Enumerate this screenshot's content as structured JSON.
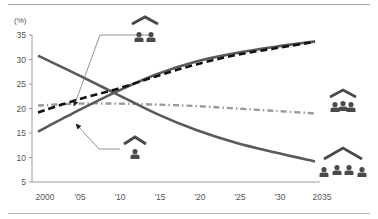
{
  "chart_data": {
    "type": "line",
    "title": "",
    "ylabel": "(%)",
    "xlabel": "",
    "ylim": [
      5,
      35
    ],
    "yticks": [
      5,
      10,
      15,
      20,
      25,
      30,
      35
    ],
    "x": [
      2000,
      2005,
      2010,
      2015,
      2020,
      2025,
      2030,
      2035
    ],
    "xtick_labels": [
      "2000",
      "'05",
      "'10",
      "'15",
      "'20",
      "'25",
      "'30",
      "2035"
    ],
    "grid": false,
    "legend": "icons placed next to lines (no text legend)",
    "series": [
      {
        "name": "single-person household",
        "icon": "house-one-person-icon",
        "style": "solid",
        "color": "#5a5a5a",
        "values": [
          30.8,
          26.9,
          22.9,
          18.9,
          15.6,
          13.0,
          11.0,
          9.2
        ]
      },
      {
        "name": "couple-only household",
        "icon": "house-two-people-icon",
        "style": "solid",
        "color": "#5a5a5a",
        "values": [
          15.3,
          19.5,
          23.5,
          27.0,
          29.6,
          31.3,
          32.6,
          33.7
        ]
      },
      {
        "name": "couple-only household (alt.)",
        "icon": "house-two-people-icon",
        "style": "dashed",
        "color": "#111111",
        "values": [
          19.2,
          21.8,
          24.0,
          26.6,
          29.0,
          30.9,
          32.3,
          33.6
        ]
      },
      {
        "name": "couple with children household",
        "icon": "house-three-people-icon",
        "style": "dash-dot",
        "color": "#9a9a9a",
        "values": [
          20.6,
          21.0,
          21.0,
          20.8,
          20.5,
          20.0,
          19.5,
          19.0
        ]
      }
    ],
    "annotations": [
      {
        "type": "arrow",
        "label_icon": "house-two-people-icon",
        "points_to": "dashed line near 2005"
      },
      {
        "type": "arrow",
        "label_icon": "house-one-person-icon",
        "points_to": "rising solid line near 2005"
      },
      {
        "type": "icon",
        "label_icon": "house-three-people-icon",
        "position": "end of dash-dot line"
      },
      {
        "type": "icon",
        "label_icon": "house-four-people-icon",
        "position": "end of declining solid line"
      }
    ]
  },
  "axis": {
    "unit_label": "(%)"
  },
  "colors": {
    "frame_line": "#a8a8a8",
    "axis": "#9a9a9a",
    "text": "#555555",
    "icon": "#4a4a4a"
  }
}
